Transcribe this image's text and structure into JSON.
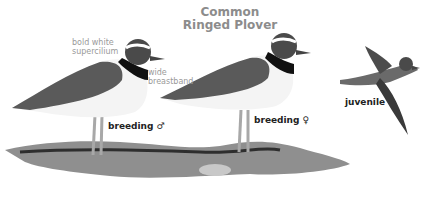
{
  "title": {
    "line1": "Common",
    "line2": "Ringed Plover"
  },
  "annotations": {
    "supercilium_1": "bold white",
    "supercilium_2": "supercilium",
    "breastband_1": "wide",
    "breastband_2": "breastband"
  },
  "labels": {
    "male": "breeding ♂",
    "female": "breeding ♀",
    "juvenile": "juvenile"
  }
}
